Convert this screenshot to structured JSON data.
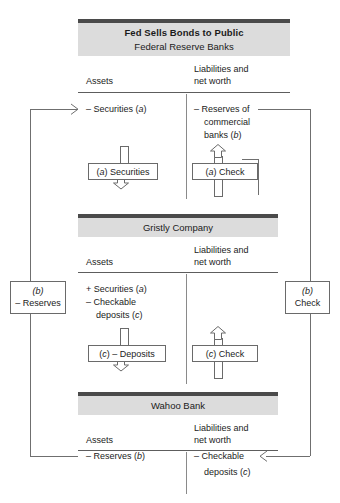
{
  "diagram": {
    "title": "Fed Sells Bonds to Public",
    "panels": [
      {
        "name": "federal-reserve-banks",
        "subtitle": "Federal Reserve Banks",
        "assets_header": "Assets",
        "liabilities_header_line1": "Liabilities and",
        "liabilities_header_line2": "net worth",
        "assets_entries": [
          {
            "sign": "–",
            "text": "Securities (",
            "note": "a",
            "close": ")"
          }
        ],
        "assets_entry_text": "– Securities (a)",
        "liabilities_entry_line1": "– Reserves of",
        "liabilities_entry_line2": "commercial",
        "liabilities_entry_line3": "banks (b)",
        "asset_box_label": "(a) Securities",
        "liability_box_label": "(a) Check"
      },
      {
        "name": "gristly-company",
        "subtitle": "Gristly Company",
        "assets_header": "Assets",
        "liabilities_header_line1": "Liabilities and",
        "liabilities_header_line2": "net worth",
        "assets_entry_line1": "+ Securities (a)",
        "assets_entry_line2": "– Checkable",
        "assets_entry_line3": "deposits (c)",
        "asset_box_label": "(c) – Deposits",
        "liability_box_label": "(c) Check"
      },
      {
        "name": "wahoo-bank",
        "subtitle": "Wahoo Bank",
        "assets_header": "Assets",
        "liabilities_header_line1": "Liabilities and",
        "liabilities_header_line2": "net worth",
        "assets_entry_line1": "– Reserves (b)",
        "liabilities_entry_line1": "– Checkable",
        "liabilities_entry_line2": "deposits (c)"
      }
    ],
    "side_boxes": [
      {
        "name": "left-reserves",
        "line1": "(b)",
        "line2": "– Reserves"
      },
      {
        "name": "right-check",
        "line1": "(b)",
        "line2": "Check"
      }
    ],
    "colors": {
      "bar_dark": "#4a4a4a",
      "bar_gray": "#dcdcdc",
      "rule": "#5d5d5d",
      "line": "#6f6f6f",
      "text": "#1b1b1b"
    }
  }
}
